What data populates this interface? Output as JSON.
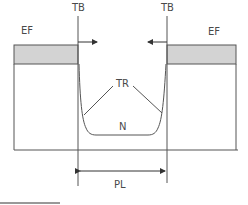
{
  "diagram": {
    "labels": {
      "tb_left": "TB",
      "tb_right": "TB",
      "ef_left": "EF",
      "ef_right": "EF",
      "tr": "TR",
      "n": "N",
      "pl": "PL"
    },
    "colors": {
      "line": "#555555",
      "shaded_band": "#d3d3d3",
      "background": "#ffffff",
      "text": "#4a4a4a"
    }
  }
}
